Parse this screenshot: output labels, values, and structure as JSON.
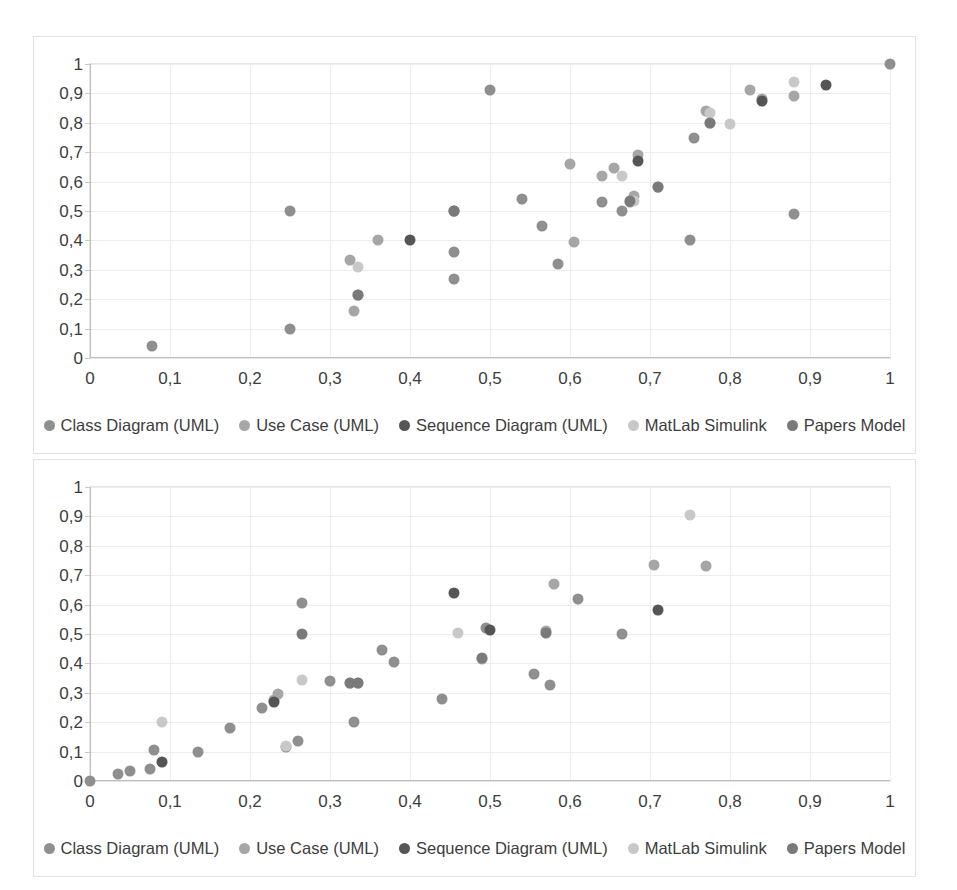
{
  "series_defs": [
    {
      "key": "class",
      "label": "Class Diagram (UML)",
      "color": "#8f8f8f"
    },
    {
      "key": "usecase",
      "label": "Use Case (UML)",
      "color": "#a6a6a6"
    },
    {
      "key": "sequence",
      "label": "Sequence Diagram (UML)",
      "color": "#555555"
    },
    {
      "key": "matlab",
      "label": "MatLab Simulink",
      "color": "#c8c8c8"
    },
    {
      "key": "papers",
      "label": "Papers Model",
      "color": "#7a7a7a"
    }
  ],
  "charts": [
    {
      "id": "chart-top",
      "chart_data": {
        "type": "scatter",
        "title": "",
        "xlabel": "",
        "ylabel": "",
        "xlim": [
          0,
          1
        ],
        "ylim": [
          0,
          1
        ],
        "xticks": [
          "0",
          "0,1",
          "0,2",
          "0,3",
          "0,4",
          "0,5",
          "0,6",
          "0,7",
          "0,8",
          "0,9",
          "1"
        ],
        "yticks": [
          "0",
          "0,1",
          "0,2",
          "0,3",
          "0,4",
          "0,5",
          "0,6",
          "0,7",
          "0,8",
          "0,9",
          "1"
        ],
        "xtick_values": [
          0,
          0.1,
          0.2,
          0.3,
          0.4,
          0.5,
          0.6,
          0.7,
          0.8,
          0.9,
          1
        ],
        "ytick_values": [
          0,
          0.1,
          0.2,
          0.3,
          0.4,
          0.5,
          0.6,
          0.7,
          0.8,
          0.9,
          1
        ],
        "grid": true,
        "legend_position": "bottom",
        "series": [
          {
            "name": "Class Diagram (UML)",
            "color": "#8f8f8f",
            "points": [
              [
                0.078,
                0.04
              ],
              [
                0.25,
                0.5
              ],
              [
                0.25,
                0.1
              ],
              [
                0.335,
                0.215
              ],
              [
                0.455,
                0.36
              ],
              [
                0.455,
                0.27
              ],
              [
                0.5,
                0.91
              ],
              [
                0.54,
                0.54
              ],
              [
                0.565,
                0.45
              ],
              [
                0.585,
                0.32
              ],
              [
                0.64,
                0.53
              ],
              [
                0.665,
                0.5
              ],
              [
                0.675,
                0.53
              ],
              [
                0.71,
                0.58
              ],
              [
                0.75,
                0.4
              ],
              [
                0.755,
                0.75
              ],
              [
                0.88,
                0.49
              ],
              [
                1.0,
                1.0
              ]
            ]
          },
          {
            "name": "Use Case (UML)",
            "color": "#a6a6a6",
            "points": [
              [
                0.325,
                0.335
              ],
              [
                0.33,
                0.16
              ],
              [
                0.36,
                0.4
              ],
              [
                0.6,
                0.66
              ],
              [
                0.605,
                0.395
              ],
              [
                0.64,
                0.62
              ],
              [
                0.655,
                0.645
              ],
              [
                0.68,
                0.55
              ],
              [
                0.685,
                0.69
              ],
              [
                0.77,
                0.84
              ],
              [
                0.775,
                0.8
              ],
              [
                0.825,
                0.91
              ],
              [
                0.84,
                0.88
              ],
              [
                0.88,
                0.89
              ]
            ]
          },
          {
            "name": "Sequence Diagram (UML)",
            "color": "#555555",
            "points": [
              [
                0.4,
                0.4
              ],
              [
                0.455,
                0.5
              ],
              [
                0.685,
                0.67
              ],
              [
                0.84,
                0.875
              ],
              [
                0.92,
                0.93
              ]
            ]
          },
          {
            "name": "MatLab Simulink",
            "color": "#c8c8c8",
            "points": [
              [
                0.335,
                0.31
              ],
              [
                0.665,
                0.62
              ],
              [
                0.68,
                0.535
              ],
              [
                0.775,
                0.835
              ],
              [
                0.8,
                0.795
              ],
              [
                0.88,
                0.94
              ]
            ]
          },
          {
            "name": "Papers Model",
            "color": "#7a7a7a",
            "points": [
              [
                0.335,
                0.215
              ],
              [
                0.455,
                0.5
              ],
              [
                0.675,
                0.535
              ],
              [
                0.71,
                0.58
              ],
              [
                0.775,
                0.8
              ]
            ]
          }
        ]
      },
      "legend": [
        "Class Diagram (UML)",
        "Use Case (UML)",
        "Sequence Diagram (UML)",
        "MatLab Simulink",
        "Papers Model"
      ]
    },
    {
      "id": "chart-bottom",
      "chart_data": {
        "type": "scatter",
        "title": "",
        "xlabel": "",
        "ylabel": "",
        "xlim": [
          0,
          1
        ],
        "ylim": [
          0,
          1
        ],
        "xticks": [
          "0",
          "0,1",
          "0,2",
          "0,3",
          "0,4",
          "0,5",
          "0,6",
          "0,7",
          "0,8",
          "0,9",
          "1"
        ],
        "yticks": [
          "0",
          "0,1",
          "0,2",
          "0,3",
          "0,4",
          "0,5",
          "0,6",
          "0,7",
          "0,8",
          "0,9",
          "1"
        ],
        "xtick_values": [
          0,
          0.1,
          0.2,
          0.3,
          0.4,
          0.5,
          0.6,
          0.7,
          0.8,
          0.9,
          1
        ],
        "ytick_values": [
          0,
          0.1,
          0.2,
          0.3,
          0.4,
          0.5,
          0.6,
          0.7,
          0.8,
          0.9,
          1
        ],
        "grid": true,
        "legend_position": "bottom",
        "series": [
          {
            "name": "Class Diagram (UML)",
            "color": "#8f8f8f",
            "points": [
              [
                0.0,
                0.0
              ],
              [
                0.035,
                0.025
              ],
              [
                0.05,
                0.035
              ],
              [
                0.075,
                0.04
              ],
              [
                0.08,
                0.105
              ],
              [
                0.135,
                0.1
              ],
              [
                0.175,
                0.18
              ],
              [
                0.215,
                0.25
              ],
              [
                0.245,
                0.115
              ],
              [
                0.26,
                0.135
              ],
              [
                0.265,
                0.605
              ],
              [
                0.3,
                0.34
              ],
              [
                0.33,
                0.2
              ],
              [
                0.365,
                0.445
              ],
              [
                0.38,
                0.405
              ],
              [
                0.44,
                0.28
              ],
              [
                0.495,
                0.52
              ],
              [
                0.555,
                0.365
              ],
              [
                0.575,
                0.325
              ],
              [
                0.61,
                0.62
              ],
              [
                0.665,
                0.5
              ]
            ]
          },
          {
            "name": "Use Case (UML)",
            "color": "#a6a6a6",
            "points": [
              [
                0.23,
                0.275
              ],
              [
                0.235,
                0.295
              ],
              [
                0.325,
                0.335
              ],
              [
                0.335,
                0.335
              ],
              [
                0.49,
                0.415
              ],
              [
                0.57,
                0.51
              ],
              [
                0.58,
                0.67
              ],
              [
                0.705,
                0.735
              ],
              [
                0.77,
                0.73
              ]
            ]
          },
          {
            "name": "Sequence Diagram (UML)",
            "color": "#555555",
            "points": [
              [
                0.09,
                0.065
              ],
              [
                0.23,
                0.27
              ],
              [
                0.455,
                0.64
              ],
              [
                0.5,
                0.515
              ],
              [
                0.71,
                0.58
              ]
            ]
          },
          {
            "name": "MatLab Simulink",
            "color": "#c8c8c8",
            "points": [
              [
                0.09,
                0.2
              ],
              [
                0.245,
                0.12
              ],
              [
                0.265,
                0.345
              ],
              [
                0.46,
                0.505
              ],
              [
                0.75,
                0.905
              ]
            ]
          },
          {
            "name": "Papers Model",
            "color": "#7a7a7a",
            "points": [
              [
                0.265,
                0.5
              ],
              [
                0.325,
                0.335
              ],
              [
                0.335,
                0.335
              ],
              [
                0.49,
                0.42
              ],
              [
                0.57,
                0.505
              ]
            ]
          }
        ]
      },
      "legend": [
        "Class Diagram (UML)",
        "Use Case (UML)",
        "Sequence Diagram (UML)",
        "MatLab Simulink",
        "Papers Model"
      ]
    }
  ]
}
